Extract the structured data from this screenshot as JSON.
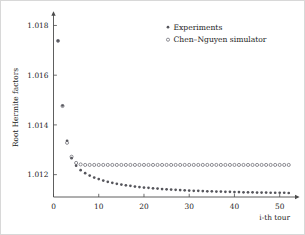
{
  "chart_data": {
    "type": "scatter",
    "title": "",
    "xlabel": "i-th tour",
    "ylabel": "Root Hermite factors",
    "xlim": [
      0,
      52.5
    ],
    "ylim": [
      1.0111,
      1.0183
    ],
    "grid": false,
    "legend_position": "top-right",
    "xticks": [
      0,
      10,
      20,
      30,
      40,
      50
    ],
    "xticklabels": [
      "0",
      "10",
      "20",
      "30",
      "40",
      "50"
    ],
    "yticks": [
      1.012,
      1.014,
      1.016,
      1.018
    ],
    "yticklabels": [
      "1.012",
      "1.014",
      "1.016",
      "1.018"
    ],
    "series": [
      {
        "name": "Experiments",
        "marker": "filled-dot",
        "color": "#55555b",
        "x": [
          1,
          2,
          3,
          4,
          5,
          6,
          7,
          8,
          9,
          10,
          11,
          12,
          13,
          14,
          15,
          16,
          17,
          18,
          19,
          20,
          21,
          22,
          23,
          24,
          25,
          26,
          27,
          28,
          29,
          30,
          31,
          32,
          33,
          34,
          35,
          36,
          37,
          38,
          39,
          40,
          41,
          42,
          43,
          44,
          45,
          46,
          47,
          48,
          49,
          50,
          51,
          52
        ],
        "values": [
          1.01738,
          1.01478,
          1.01336,
          1.01266,
          1.01236,
          1.01218,
          1.01206,
          1.01196,
          1.01188,
          1.01182,
          1.01176,
          1.01171,
          1.01167,
          1.01163,
          1.0116,
          1.01157,
          1.01155,
          1.01152,
          1.0115,
          1.01148,
          1.01147,
          1.01145,
          1.01144,
          1.01142,
          1.01141,
          1.0114,
          1.01139,
          1.01138,
          1.01137,
          1.01136,
          1.01135,
          1.01135,
          1.01134,
          1.01133,
          1.01133,
          1.01132,
          1.01132,
          1.01131,
          1.01131,
          1.0113,
          1.0113,
          1.01129,
          1.01129,
          1.01129,
          1.01128,
          1.01128,
          1.01128,
          1.01127,
          1.01127,
          1.01127,
          1.01127,
          1.01126
        ]
      },
      {
        "name": "Chen-Nguyen simulator",
        "marker": "open-circle",
        "color": "#6a6a72",
        "x": [
          1,
          2,
          3,
          4,
          5,
          6,
          7,
          8,
          9,
          10,
          11,
          12,
          13,
          14,
          15,
          16,
          17,
          18,
          19,
          20,
          21,
          22,
          23,
          24,
          25,
          26,
          27,
          28,
          29,
          30,
          31,
          32,
          33,
          34,
          35,
          36,
          37,
          38,
          39,
          40,
          41,
          42,
          43,
          44,
          45,
          46,
          47,
          48,
          49,
          50,
          51,
          52
        ],
        "values": [
          1.01738,
          1.01476,
          1.01328,
          1.01272,
          1.01247,
          1.01241,
          1.01239,
          1.01239,
          1.01239,
          1.01239,
          1.01239,
          1.01239,
          1.01239,
          1.01239,
          1.01239,
          1.01239,
          1.01239,
          1.01239,
          1.01239,
          1.01239,
          1.01239,
          1.01239,
          1.01239,
          1.01239,
          1.01239,
          1.01239,
          1.01239,
          1.01239,
          1.01239,
          1.01239,
          1.01239,
          1.01239,
          1.01239,
          1.01239,
          1.01239,
          1.01239,
          1.01239,
          1.01239,
          1.01239,
          1.01239,
          1.01239,
          1.01239,
          1.01239,
          1.01239,
          1.01239,
          1.01239,
          1.01239,
          1.01239,
          1.01239,
          1.01239,
          1.01239,
          1.01239
        ]
      }
    ]
  },
  "legend": {
    "entries": [
      {
        "label": "Experiments",
        "marker": "filled-dot"
      },
      {
        "label": "Chen-Nguyen simulator",
        "marker": "open-circle"
      }
    ]
  },
  "axes": {
    "x_title": "i-th tour",
    "y_title": "Root Hermite factors"
  }
}
